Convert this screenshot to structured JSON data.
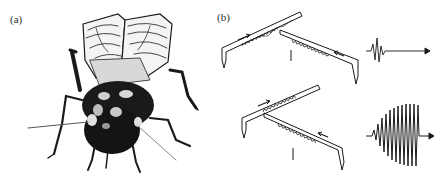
{
  "figure": {
    "panels": [
      {
        "id": "a",
        "label": "(a)",
        "content": "cricket-illustration"
      },
      {
        "id": "b",
        "label": "(b)",
        "content": "stridulation-diagram"
      }
    ],
    "panel_b": {
      "rows": [
        {
          "name": "top",
          "description": "file and scraper with wings closing; short pulse waveform",
          "waveform": "short-pulse"
        },
        {
          "name": "bottom",
          "description": "file and scraper; long tonal pulse waveform",
          "waveform": "tonal-burst"
        }
      ]
    },
    "colors": {
      "ink": "#1a1a1a",
      "background": "#ffffff",
      "label": "#333333"
    }
  }
}
